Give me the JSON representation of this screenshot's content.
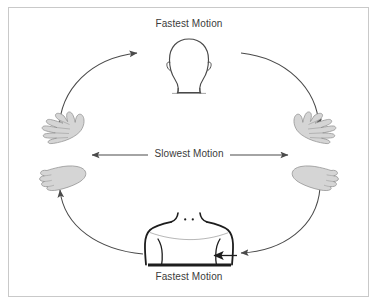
{
  "diagram": {
    "background_color": "#ffffff",
    "border_color": "#c9c9c9",
    "line_color": "#4a4a4a",
    "figure_fill": "#d0d0d0",
    "figure_stroke": "#8a8a8a",
    "text_color": "#3b3b3b",
    "labels": {
      "top": "Fastest Motion",
      "center": "Slowest Motion",
      "bottom": "Fastest Motion"
    },
    "nodes": [
      {
        "id": "head",
        "name": "head-figure",
        "position": "top",
        "label": "Head"
      },
      {
        "id": "left-limbs",
        "name": "left-hand-foot-figure",
        "position": "left",
        "label": "Hand and Foot"
      },
      {
        "id": "right-limbs",
        "name": "right-hand-foot-figure",
        "position": "right",
        "label": "Hand and Foot"
      },
      {
        "id": "torso",
        "name": "torso-figure",
        "position": "bottom",
        "label": "Torso"
      }
    ],
    "arrows": [
      {
        "id": "arc-left-top",
        "name": "arc-left-hand-to-head",
        "from": "left-limbs",
        "to": "head",
        "style": "curved"
      },
      {
        "id": "arc-right-top",
        "name": "arc-head-to-right-hand",
        "from": "head",
        "to": "right-limbs",
        "style": "curved"
      },
      {
        "id": "arc-right-bottom",
        "name": "arc-right-foot-to-torso",
        "from": "right-limbs",
        "to": "torso",
        "style": "curved"
      },
      {
        "id": "arc-left-bottom",
        "name": "arc-torso-to-left-foot",
        "from": "torso",
        "to": "left-limbs",
        "style": "curved"
      },
      {
        "id": "center-arrow",
        "name": "slowest-motion-double-arrow",
        "from": "left-limbs",
        "to": "right-limbs",
        "style": "double-headed-straight"
      }
    ]
  }
}
